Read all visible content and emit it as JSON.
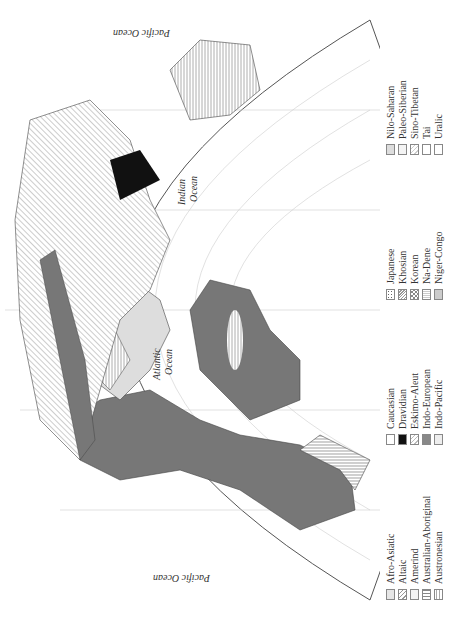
{
  "map": {
    "title": "World Language Families",
    "oceans": [
      {
        "name": "Pacific Ocean",
        "x": 45,
        "y": 210
      },
      {
        "name": "Atlantic Ocean",
        "x": 250,
        "y": 150
      },
      {
        "name": "Indian Ocean",
        "x": 420,
        "y": 185
      },
      {
        "name": "Pacific Ocean",
        "x": 590,
        "y": 150
      }
    ]
  },
  "legend": {
    "columns": [
      [
        {
          "label": "Afro-Asiatic",
          "pattern": "dots-light"
        },
        {
          "label": "Altaic",
          "pattern": "diag"
        },
        {
          "label": "Amerind",
          "pattern": "light-vert"
        },
        {
          "label": "Australian-Aboriginal",
          "pattern": "vert"
        },
        {
          "label": "Austronesian",
          "pattern": "grid"
        }
      ],
      [
        {
          "label": "Caucasian",
          "pattern": "blank"
        },
        {
          "label": "Dravidian",
          "pattern": "black"
        },
        {
          "label": "Eskimo-Aleut",
          "pattern": "diag-light"
        },
        {
          "label": "Indo-European",
          "pattern": "dark"
        },
        {
          "label": "Indo-Pacific",
          "pattern": "light"
        }
      ],
      [
        {
          "label": "Japanese",
          "pattern": "speckle"
        },
        {
          "label": "Khosian",
          "pattern": "cross"
        },
        {
          "label": "Korean",
          "pattern": "checker"
        },
        {
          "label": "Na-Dene",
          "pattern": "fine-vert"
        },
        {
          "label": "Niger-Congo",
          "pattern": "gray"
        }
      ],
      [
        {
          "label": "Nilo-Saharan",
          "pattern": "gray-dots"
        },
        {
          "label": "Paleo-Siberian",
          "pattern": "light-vert"
        },
        {
          "label": "Sino-Tibetan",
          "pattern": "diag-light"
        },
        {
          "label": "Tai",
          "pattern": "blank"
        },
        {
          "label": "Uralic",
          "pattern": "blank"
        }
      ]
    ]
  }
}
